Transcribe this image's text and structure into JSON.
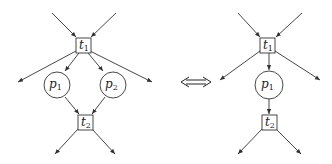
{
  "diagram": {
    "type": "petri-net-equivalence",
    "equivalence_symbol": "⟺",
    "left": {
      "transitions": [
        {
          "id": "t1",
          "base": "t",
          "sub": "1",
          "cx": 83,
          "cy": 45
        },
        {
          "id": "t2",
          "base": "t",
          "sub": "2",
          "cx": 85,
          "cy": 122
        }
      ],
      "places": [
        {
          "id": "p1",
          "base": "p",
          "sub": "1",
          "cx": 57,
          "cy": 85,
          "r": 13
        },
        {
          "id": "p2",
          "base": "p",
          "sub": "2",
          "cx": 113,
          "cy": 85,
          "r": 13
        }
      ],
      "edges": [
        {
          "from": "in-left",
          "to": "t1"
        },
        {
          "from": "in-right",
          "to": "t1"
        },
        {
          "from": "t1",
          "to": "p1"
        },
        {
          "from": "t1",
          "to": "p2"
        },
        {
          "from": "t1",
          "to": "out-left"
        },
        {
          "from": "t1",
          "to": "out-right"
        },
        {
          "from": "p1",
          "to": "t2"
        },
        {
          "from": "p2",
          "to": "t2"
        },
        {
          "from": "t2",
          "to": "out-bottom-left"
        },
        {
          "from": "t2",
          "to": "out-bottom-right"
        }
      ]
    },
    "right": {
      "transitions": [
        {
          "id": "t1",
          "base": "t",
          "sub": "1",
          "cx": 267,
          "cy": 45
        },
        {
          "id": "t2",
          "base": "t",
          "sub": "2",
          "cx": 269,
          "cy": 122
        }
      ],
      "places": [
        {
          "id": "p1",
          "base": "p",
          "sub": "1",
          "cx": 269,
          "cy": 85,
          "r": 14
        }
      ],
      "edges": [
        {
          "from": "in-left",
          "to": "t1"
        },
        {
          "from": "in-right",
          "to": "t1"
        },
        {
          "from": "t1",
          "to": "p1"
        },
        {
          "from": "t1",
          "to": "out-left"
        },
        {
          "from": "t1",
          "to": "out-right"
        },
        {
          "from": "p1",
          "to": "t2"
        },
        {
          "from": "t2",
          "to": "out-bottom-left"
        },
        {
          "from": "t2",
          "to": "out-bottom-right"
        }
      ]
    }
  }
}
